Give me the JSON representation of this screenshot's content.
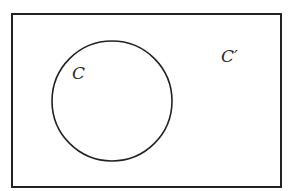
{
  "diagram": {
    "type": "venn",
    "universe": {
      "x": 12,
      "y": 14,
      "width": 269,
      "height": 173,
      "stroke": "#222222"
    },
    "sets": [
      {
        "name": "C",
        "cx": 112,
        "cy": 101,
        "r": 60,
        "stroke": "#222222"
      }
    ],
    "labels": {
      "set": "C",
      "complement": "C′"
    }
  }
}
